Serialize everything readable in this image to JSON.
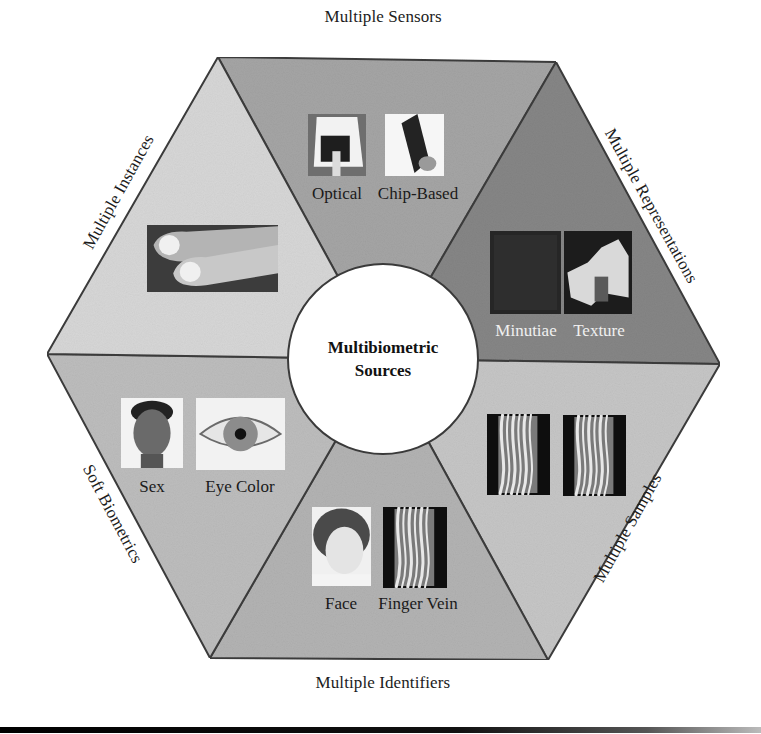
{
  "diagram": {
    "title": "Multibiometric Sources",
    "center": {
      "lines": [
        "Multibiometric",
        "Sources"
      ],
      "cx": 383,
      "cy": 359,
      "r": 96
    },
    "vertices": {
      "TL": [
        218,
        57
      ],
      "TR": [
        556,
        62
      ],
      "R": [
        720,
        364
      ],
      "BR": [
        548,
        660
      ],
      "BL": [
        210,
        658
      ],
      "L": [
        47,
        354
      ]
    },
    "segments": [
      {
        "id": "multiple-sensors",
        "label": "Multiple Sensors",
        "fill": "#a5a5a5",
        "corners": [
          "TL",
          "TR"
        ],
        "label_pos": {
          "x": 383,
          "y": 17,
          "rotate": 0
        },
        "items": [
          {
            "caption": "Optical",
            "kind": "optical-sensor",
            "x": 308,
            "y": 114,
            "w": 58,
            "h": 62,
            "cap_x": 337,
            "cap_y": 184,
            "light": false
          },
          {
            "caption": "Chip-Based",
            "kind": "chip-sensor",
            "x": 385,
            "y": 114,
            "w": 59,
            "h": 62,
            "cap_x": 418,
            "cap_y": 184,
            "light": false
          }
        ]
      },
      {
        "id": "multiple-representations",
        "label": "Multiple Representations",
        "fill": "#868686",
        "corners": [
          "TR",
          "R"
        ],
        "label_pos": {
          "x": 651,
          "y": 206,
          "rotate": 61
        },
        "items": [
          {
            "caption": "Minutiae",
            "kind": "minutiae",
            "x": 490,
            "y": 231,
            "w": 71,
            "h": 83,
            "cap_x": 526,
            "cap_y": 321,
            "light": true
          },
          {
            "caption": "Texture",
            "kind": "texture",
            "x": 564,
            "y": 231,
            "w": 68,
            "h": 83,
            "cap_x": 599,
            "cap_y": 321,
            "light": true
          }
        ]
      },
      {
        "id": "multiple-samples",
        "label": "Multiple Samples",
        "fill": "#c6c6c6",
        "corners": [
          "R",
          "BR"
        ],
        "label_pos": {
          "x": 628,
          "y": 528,
          "rotate": -61
        },
        "items": [
          {
            "caption": "",
            "kind": "vein-a",
            "x": 487,
            "y": 414,
            "w": 63,
            "h": 81,
            "cap_x": 0,
            "cap_y": 0,
            "light": false
          },
          {
            "caption": "",
            "kind": "vein-b",
            "x": 563,
            "y": 415,
            "w": 63,
            "h": 81,
            "cap_x": 0,
            "cap_y": 0,
            "light": false
          }
        ]
      },
      {
        "id": "multiple-identifiers",
        "label": "Multiple Identifiers",
        "fill": "#b3b3b3",
        "corners": [
          "BR",
          "BL"
        ],
        "label_pos": {
          "x": 383,
          "y": 683,
          "rotate": 0
        },
        "items": [
          {
            "caption": "Face",
            "kind": "face-woman",
            "x": 312,
            "y": 507,
            "w": 59,
            "h": 79,
            "cap_x": 341,
            "cap_y": 594,
            "light": false
          },
          {
            "caption": "Finger Vein",
            "kind": "vein-c",
            "x": 383,
            "y": 507,
            "w": 64,
            "h": 81,
            "cap_x": 418,
            "cap_y": 594,
            "light": false
          }
        ]
      },
      {
        "id": "soft-biometrics",
        "label": "Soft Biometrics",
        "fill": "#bdbdbd",
        "corners": [
          "BL",
          "L"
        ],
        "label_pos": {
          "x": 112,
          "y": 514,
          "rotate": 62
        },
        "items": [
          {
            "caption": "Sex",
            "kind": "face-man",
            "x": 121,
            "y": 398,
            "w": 62,
            "h": 70,
            "cap_x": 152,
            "cap_y": 477,
            "light": false
          },
          {
            "caption": "Eye Color",
            "kind": "eye",
            "x": 196,
            "y": 398,
            "w": 89,
            "h": 72,
            "cap_x": 240,
            "cap_y": 477,
            "light": false
          }
        ]
      },
      {
        "id": "multiple-instances",
        "label": "Multiple Instances",
        "fill": "#d7d7d7",
        "corners": [
          "L",
          "TL"
        ],
        "label_pos": {
          "x": 119,
          "y": 192,
          "rotate": -61
        },
        "items": [
          {
            "caption": "",
            "kind": "fingers",
            "x": 147,
            "y": 225,
            "w": 131,
            "h": 67,
            "cap_x": 0,
            "cap_y": 0,
            "light": false
          }
        ]
      }
    ],
    "stroke_color": "#3c3c3c"
  }
}
